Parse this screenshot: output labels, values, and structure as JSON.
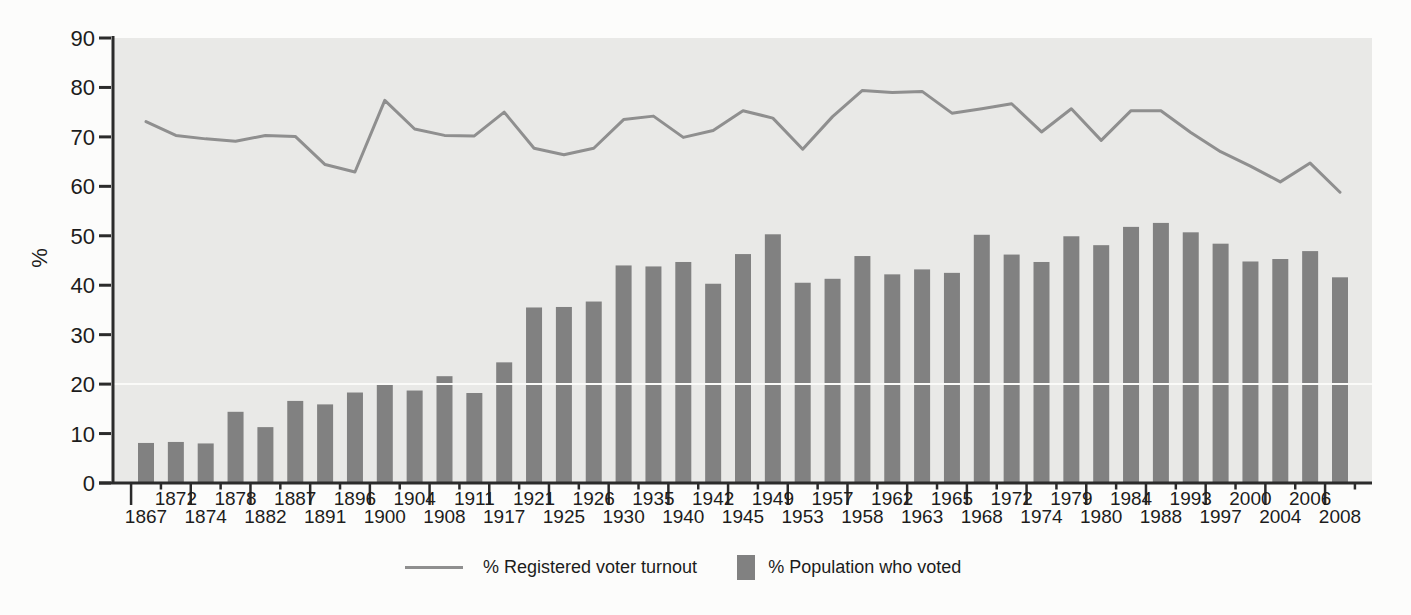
{
  "figure": {
    "background": "#fcfcfb",
    "axis_color": "#2b2b2b",
    "text_color": "#1c1c1c"
  },
  "legend": {
    "line_label": "% Registered voter turnout",
    "bar_label": "% Population who voted"
  },
  "chart_data": {
    "type": "bar",
    "subtype": "bar+line combo",
    "title": "",
    "xlabel": "",
    "ylabel": "%",
    "ylim": [
      0,
      90
    ],
    "yticks": [
      0,
      10,
      20,
      30,
      40,
      50,
      60,
      70,
      80,
      90
    ],
    "grid": "single white horizontal line at y=20",
    "legend_position": "bottom-center",
    "plot_background": "#e9e9e7",
    "categories": [
      "1867",
      "1872",
      "1874",
      "1878",
      "1882",
      "1887",
      "1891",
      "1896",
      "1900",
      "1904",
      "1908",
      "1911",
      "1917",
      "1921",
      "1925",
      "1926",
      "1930",
      "1935",
      "1940",
      "1942",
      "1945",
      "1949",
      "1953",
      "1957",
      "1958",
      "1962",
      "1963",
      "1965",
      "1968",
      "1972",
      "1974",
      "1979",
      "1980",
      "1984",
      "1988",
      "1993",
      "1997",
      "2000",
      "2004",
      "2006",
      "2008"
    ],
    "series": [
      {
        "name": "% Registered voter turnout",
        "type": "line",
        "color": "#8f8f8f",
        "values": [
          73.1,
          70.3,
          69.6,
          69.1,
          70.3,
          70.1,
          64.4,
          62.9,
          77.4,
          71.6,
          70.3,
          70.2,
          75.0,
          67.7,
          66.4,
          67.7,
          73.5,
          74.2,
          69.9,
          71.3,
          75.3,
          73.8,
          67.5,
          74.1,
          79.4,
          79.0,
          79.2,
          74.8,
          75.7,
          76.7,
          71.0,
          75.7,
          69.3,
          75.3,
          75.3,
          70.9,
          67.0,
          64.1,
          60.9,
          64.7,
          58.8
        ]
      },
      {
        "name": "% Population who voted",
        "type": "bar",
        "color": "#818181",
        "values": [
          8.1,
          8.3,
          8.0,
          14.4,
          11.3,
          16.6,
          15.9,
          18.3,
          19.9,
          18.7,
          21.6,
          18.2,
          24.4,
          35.5,
          35.6,
          36.7,
          44.0,
          43.8,
          44.7,
          40.3,
          46.3,
          50.3,
          40.5,
          41.3,
          45.9,
          42.2,
          43.2,
          42.5,
          50.2,
          46.2,
          44.7,
          49.9,
          48.1,
          51.8,
          52.6,
          50.7,
          48.4,
          44.8,
          45.3,
          46.9,
          41.6
        ]
      }
    ]
  }
}
